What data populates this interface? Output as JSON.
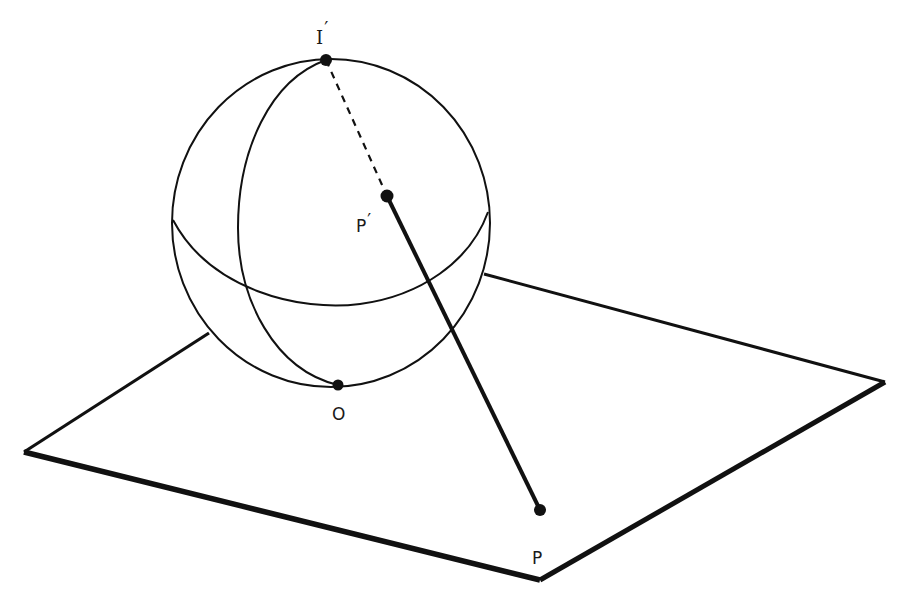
{
  "figure": {
    "stroke_color": "#111111",
    "background_color": "#ffffff"
  },
  "points": {
    "north_pole": {
      "label": "I",
      "prime": "′"
    },
    "sphere_point": {
      "label": "P",
      "prime": "′"
    },
    "tangent_point": {
      "label": "O"
    },
    "plane_point": {
      "label": "P"
    }
  },
  "segments": {
    "pole_to_sphere_point": {
      "style": "dashed"
    },
    "sphere_point_to_plane_point": {
      "style": "solid"
    }
  }
}
